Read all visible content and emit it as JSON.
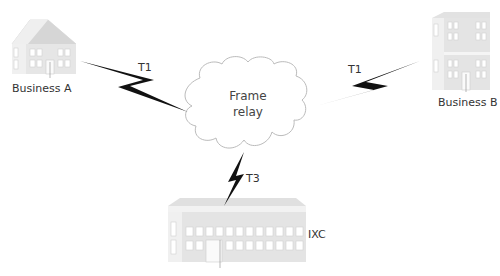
{
  "nodes": {
    "business_a": {
      "label": "Business A"
    },
    "business_b": {
      "label": "Business B"
    },
    "ixc": {
      "label": "IXC"
    },
    "cloud": {
      "line1": "Frame",
      "line2": "relay"
    }
  },
  "links": [
    {
      "from": "Business A",
      "to": "Frame relay",
      "label": "T1"
    },
    {
      "from": "Business B",
      "to": "Frame relay",
      "label": "T1"
    },
    {
      "from": "IXC",
      "to": "Frame relay",
      "label": "T3"
    }
  ],
  "colors": {
    "building_fill": "#ececec",
    "building_shade": "#d4d4d4",
    "bolt": "#111111",
    "cloud_stroke": "#bbbbbb"
  }
}
